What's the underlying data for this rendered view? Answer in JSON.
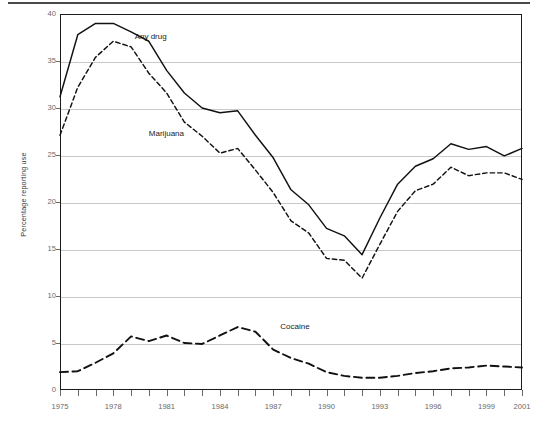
{
  "figure": {
    "y_axis_title": "Percentage reporting use",
    "has_top_rule": true
  },
  "chart_data": {
    "type": "line",
    "title": "",
    "subtitle": "",
    "xlabel": "",
    "ylabel": "Percentage reporting use",
    "xlim": [
      1975,
      2001
    ],
    "ylim": [
      0,
      40
    ],
    "grid": "horizontal",
    "legend": "inline-annotations",
    "y_ticks": [
      0,
      5,
      10,
      15,
      20,
      25,
      30,
      35,
      40
    ],
    "y_tick_labels": [
      "0",
      "5",
      "10",
      "15",
      "20",
      "25",
      "30",
      "35",
      "40"
    ],
    "x_ticks": [
      1975,
      1976,
      1977,
      1978,
      1979,
      1980,
      1981,
      1982,
      1983,
      1984,
      1985,
      1986,
      1987,
      1988,
      1989,
      1990,
      1991,
      1992,
      1993,
      1994,
      1995,
      1996,
      1997,
      1998,
      1999,
      2000,
      2001
    ],
    "x_tick_labels_shown": [
      "1975",
      "1978",
      "1981",
      "1984",
      "1987",
      "1990",
      "1993",
      "1996",
      "1999",
      "2001"
    ],
    "x": [
      1975,
      1976,
      1977,
      1978,
      1979,
      1980,
      1981,
      1982,
      1983,
      1984,
      1985,
      1986,
      1987,
      1988,
      1989,
      1990,
      1991,
      1992,
      1993,
      1994,
      1995,
      1996,
      1997,
      1998,
      1999,
      2000,
      2001
    ],
    "series": [
      {
        "name": "Any drug",
        "style": "solid",
        "color": "#111111",
        "label_x": 1979.2,
        "label_y": 37.6,
        "values": [
          31.2,
          37.8,
          39.0,
          39.0,
          38.1,
          37.1,
          34.0,
          31.6,
          30.0,
          29.5,
          29.7,
          27.1,
          24.7,
          21.3,
          19.7,
          17.2,
          16.4,
          14.4,
          18.3,
          21.9,
          23.8,
          24.6,
          26.2,
          25.6,
          25.9,
          24.9,
          25.7
        ]
      },
      {
        "name": "Marijuana",
        "style": "dashed",
        "color": "#111111",
        "label_x": 1980.0,
        "label_y": 27.2,
        "values": [
          27.1,
          32.2,
          35.4,
          37.1,
          36.5,
          33.7,
          31.6,
          28.5,
          27.0,
          25.2,
          25.7,
          23.4,
          21.0,
          18.0,
          16.7,
          14.0,
          13.8,
          11.9,
          15.5,
          19.0,
          21.2,
          21.9,
          23.7,
          22.8,
          23.1,
          23.1,
          22.4
        ]
      },
      {
        "name": "Cocaine",
        "style": "dashed-coarse",
        "color": "#111111",
        "label_x": 1987.4,
        "label_y": 6.7,
        "values": [
          1.9,
          2.0,
          2.9,
          3.9,
          5.7,
          5.2,
          5.8,
          5.0,
          4.9,
          5.8,
          6.7,
          6.2,
          4.3,
          3.4,
          2.8,
          1.9,
          1.5,
          1.3,
          1.3,
          1.5,
          1.8,
          2.0,
          2.3,
          2.4,
          2.6,
          2.5,
          2.4
        ]
      }
    ]
  }
}
